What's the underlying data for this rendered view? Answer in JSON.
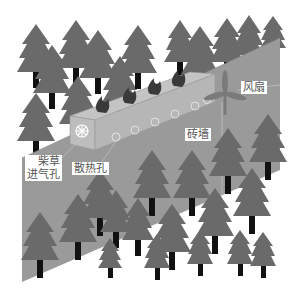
{
  "diagram": {
    "colors": {
      "ground": "#9a9a9a",
      "kiln_top": "#c4c4c4",
      "kiln_front": "#bdbdbd",
      "tree": "#6a6a6a",
      "trunk": "#111111",
      "fire": "#3a3a3a"
    },
    "labels": {
      "fan": "风扇",
      "brick_wall": "砖墙",
      "fuel_inlet": "柴草\n进气孔",
      "heat_vent": "散热孔"
    }
  }
}
